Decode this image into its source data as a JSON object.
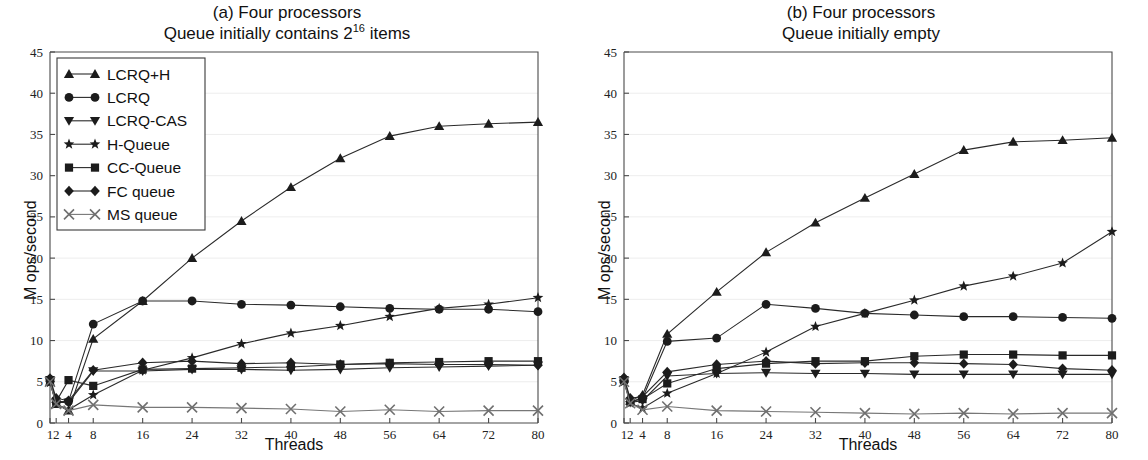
{
  "figure": {
    "ylabel": "M ops/second",
    "xlabel": "Threads",
    "y_ticks": [
      "0",
      "5",
      "10",
      "15",
      "20",
      "25",
      "30",
      "35",
      "40",
      "45"
    ],
    "x_ticks": [
      "1",
      "2",
      "4",
      "8",
      "16",
      "24",
      "32",
      "40",
      "48",
      "56",
      "64",
      "72",
      "80"
    ]
  },
  "panel_a": {
    "title_line1": "(a) Four processors",
    "title_line2_pre": "Queue initially contains 2",
    "title_line2_sup": "16",
    "title_line2_post": " items"
  },
  "panel_b": {
    "title_line1": "(b) Four processors",
    "title_line2": "Queue initially empty"
  },
  "legend": {
    "items": [
      {
        "label": "LCRQ+H",
        "marker": "triangle-up"
      },
      {
        "label": "LCRQ",
        "marker": "circle"
      },
      {
        "label": "LCRQ-CAS",
        "marker": "triangle-down"
      },
      {
        "label": "H-Queue",
        "marker": "star"
      },
      {
        "label": "CC-Queue",
        "marker": "square"
      },
      {
        "label": "FC queue",
        "marker": "diamond"
      },
      {
        "label": "MS queue",
        "marker": "cross"
      }
    ]
  },
  "chart_data": [
    {
      "id": "panel-a",
      "type": "line",
      "title": "(a) Four processors — Queue initially contains 2^16 items",
      "xlabel": "Threads",
      "ylabel": "M ops/second",
      "x": [
        1,
        2,
        4,
        8,
        16,
        24,
        32,
        40,
        48,
        56,
        64,
        72,
        80
      ],
      "xlim": [
        1,
        80
      ],
      "ylim": [
        0,
        45
      ],
      "yticks": [
        0,
        5,
        10,
        15,
        20,
        25,
        30,
        35,
        40,
        45
      ],
      "grid": true,
      "legend_position": "upper-left",
      "series": [
        {
          "name": "LCRQ+H",
          "marker": "triangle-up",
          "values": [
            5.0,
            2.3,
            1.5,
            10.2,
            14.8,
            20.0,
            24.5,
            28.6,
            32.1,
            34.8,
            36.0,
            36.3,
            36.5
          ]
        },
        {
          "name": "LCRQ",
          "marker": "circle",
          "values": [
            5.3,
            2.6,
            2.6,
            12.0,
            14.8,
            14.8,
            14.4,
            14.3,
            14.1,
            13.9,
            13.8,
            13.8,
            13.5
          ]
        },
        {
          "name": "LCRQ-CAS",
          "marker": "triangle-down",
          "values": [
            5.2,
            2.5,
            2.5,
            6.3,
            6.3,
            6.5,
            6.5,
            6.4,
            6.5,
            6.7,
            6.8,
            6.9,
            7.0
          ]
        },
        {
          "name": "H-Queue",
          "marker": "star",
          "values": [
            4.9,
            2.3,
            1.6,
            3.4,
            6.4,
            7.9,
            9.6,
            10.9,
            11.8,
            12.9,
            13.9,
            14.4,
            15.2
          ]
        },
        {
          "name": "CC-Queue",
          "marker": "square",
          "values": [
            5.2,
            2.6,
            5.2,
            4.5,
            6.5,
            6.6,
            6.7,
            6.8,
            7.1,
            7.3,
            7.4,
            7.5,
            7.5
          ]
        },
        {
          "name": "FC queue",
          "marker": "diamond",
          "values": [
            5.4,
            3.0,
            2.7,
            6.4,
            7.3,
            7.5,
            7.2,
            7.3,
            7.1,
            7.2,
            7.1,
            7.1,
            7.0
          ]
        },
        {
          "name": "MS queue",
          "marker": "cross",
          "values": [
            5.0,
            2.3,
            1.5,
            2.2,
            1.9,
            1.9,
            1.8,
            1.7,
            1.4,
            1.6,
            1.4,
            1.5,
            1.5
          ]
        }
      ]
    },
    {
      "id": "panel-b",
      "type": "line",
      "title": "(b) Four processors — Queue initially empty",
      "xlabel": "Threads",
      "ylabel": "M ops/second",
      "x": [
        1,
        2,
        4,
        8,
        16,
        24,
        32,
        40,
        48,
        56,
        64,
        72,
        80
      ],
      "xlim": [
        1,
        80
      ],
      "ylim": [
        0,
        45
      ],
      "yticks": [
        0,
        5,
        10,
        15,
        20,
        25,
        30,
        35,
        40,
        45
      ],
      "grid": true,
      "legend_position": "none",
      "series": [
        {
          "name": "LCRQ+H",
          "marker": "triangle-up",
          "values": [
            5.4,
            2.7,
            3.4,
            10.8,
            15.9,
            20.7,
            24.3,
            27.3,
            30.2,
            33.1,
            34.1,
            34.3,
            34.6
          ]
        },
        {
          "name": "LCRQ",
          "marker": "circle",
          "values": [
            5.3,
            2.6,
            3.0,
            9.9,
            10.3,
            14.4,
            13.9,
            13.3,
            13.1,
            12.9,
            12.9,
            12.8,
            12.7
          ]
        },
        {
          "name": "LCRQ-CAS",
          "marker": "triangle-down",
          "values": [
            5.2,
            2.5,
            2.7,
            5.7,
            6.0,
            6.1,
            6.0,
            6.0,
            5.9,
            5.9,
            5.9,
            5.9,
            5.9
          ]
        },
        {
          "name": "H-Queue",
          "marker": "star",
          "values": [
            5.0,
            2.4,
            1.8,
            3.6,
            6.0,
            8.6,
            11.7,
            13.3,
            14.9,
            16.6,
            17.8,
            19.4,
            23.2
          ]
        },
        {
          "name": "CC-Queue",
          "marker": "square",
          "values": [
            5.2,
            2.6,
            2.9,
            4.8,
            6.6,
            7.2,
            7.5,
            7.5,
            8.1,
            8.3,
            8.3,
            8.2,
            8.2
          ]
        },
        {
          "name": "FC queue",
          "marker": "diamond",
          "values": [
            5.5,
            3.0,
            3.2,
            6.2,
            7.1,
            7.5,
            7.2,
            7.3,
            7.3,
            7.2,
            7.1,
            6.6,
            6.4
          ]
        },
        {
          "name": "MS queue",
          "marker": "cross",
          "values": [
            5.0,
            2.4,
            1.6,
            2.0,
            1.5,
            1.4,
            1.3,
            1.2,
            1.1,
            1.2,
            1.1,
            1.2,
            1.2
          ]
        }
      ]
    }
  ]
}
